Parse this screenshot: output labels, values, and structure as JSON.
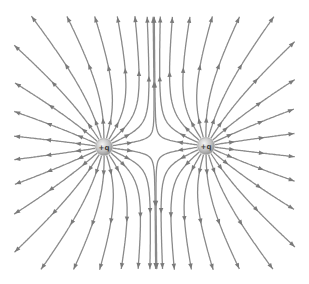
{
  "diagram": {
    "type": "electric-field-lines",
    "canvas": {
      "width": 309,
      "height": 284
    },
    "bounds": {
      "xmin": 14,
      "xmax": 295,
      "ymin": 16,
      "ymax": 270
    },
    "line_color": "#8a8a8a",
    "arrow_color": "#7a7a7a",
    "line_width": 1.3,
    "lines_per_charge": 22,
    "arrow_direction": "outward",
    "charges": [
      {
        "id": "left",
        "label": "+q",
        "x": 104,
        "y": 147,
        "sign": 1,
        "radius": 8.5
      },
      {
        "id": "right",
        "label": "+q",
        "x": 206,
        "y": 146,
        "sign": 1,
        "radius": 8.5
      }
    ]
  }
}
